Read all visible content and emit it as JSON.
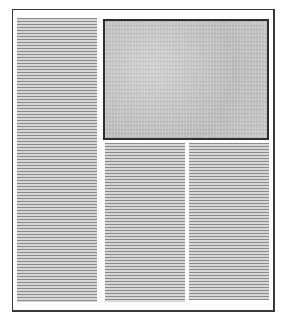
{
  "diagram": {
    "type": "page-layout-wireframe",
    "page": {
      "border_color": "#3a3a3a",
      "background": "#fdfdfd"
    },
    "regions": [
      {
        "id": "column-left",
        "kind": "text-column",
        "label": "Text column (full height)",
        "line_color": "#8a8a8a"
      },
      {
        "id": "image-top-right",
        "kind": "image",
        "label": "Image block",
        "fill": "#c4c4c4",
        "border_color": "#2e2e2e"
      },
      {
        "id": "column-middle",
        "kind": "text-column",
        "label": "Text column",
        "line_color": "#8a8a8a"
      },
      {
        "id": "column-right",
        "kind": "text-column",
        "label": "Text column",
        "line_color": "#8a8a8a"
      }
    ]
  }
}
